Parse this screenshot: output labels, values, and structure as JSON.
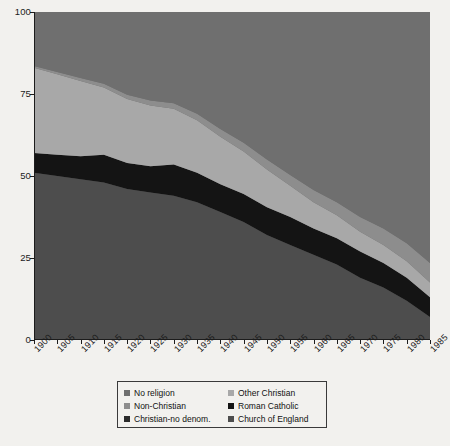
{
  "chart_data": {
    "type": "area",
    "title": "",
    "subtitle": "",
    "xlabel": "",
    "ylabel": "",
    "stacked": true,
    "percent_stacked": true,
    "grid": false,
    "legend_position": "bottom",
    "xlim": [
      1900,
      1985
    ],
    "ylim": [
      0,
      100
    ],
    "yticks": [
      0,
      25,
      50,
      75,
      100
    ],
    "categories": [
      1900,
      1905,
      1910,
      1915,
      1920,
      1925,
      1930,
      1935,
      1940,
      1945,
      1950,
      1955,
      1960,
      1965,
      1970,
      1975,
      1980,
      1985
    ],
    "xtick_labels": [
      "1900",
      "1905",
      "1910",
      "1915",
      "1920",
      "1925",
      "1930",
      "1935",
      "1940",
      "1945",
      "1950",
      "1955",
      "1960",
      "1965",
      "1970",
      "1975",
      "1980",
      "1985"
    ],
    "series": [
      {
        "name": "Church of England",
        "color": "#4d4d4d",
        "stack_order": 1,
        "values": [
          51,
          50,
          49,
          48,
          46,
          45,
          44,
          42,
          39,
          36,
          32,
          29,
          26,
          23,
          19,
          16,
          12,
          7
        ]
      },
      {
        "name": "Roman Catholic",
        "color": "#141414",
        "stack_order": 2,
        "values": [
          6,
          6.5,
          7,
          8.5,
          8,
          8,
          9.5,
          9,
          8.5,
          8.5,
          8.5,
          8.5,
          8,
          8,
          8,
          7.5,
          7,
          6
        ]
      },
      {
        "name": "Christian-no denom.",
        "color": "#5e5e5e",
        "stack_order": 3,
        "values": [
          0,
          0,
          0,
          0,
          0,
          0,
          0,
          0,
          0,
          0,
          0,
          0,
          0,
          0,
          0,
          0,
          0,
          0
        ]
      },
      {
        "name": "Other Christian",
        "color": "#a8a8a8",
        "stack_order": 4,
        "values": [
          26,
          24.5,
          23,
          20.5,
          19.5,
          18.5,
          17,
          16,
          14.5,
          13,
          11.5,
          9.5,
          8,
          7,
          6,
          5.5,
          5,
          4.5
        ]
      },
      {
        "name": "Non-Christian",
        "color": "#8d8d8d",
        "stack_order": 5,
        "values": [
          0.5,
          0.7,
          0.9,
          1.1,
          1.3,
          1.5,
          1.7,
          2.0,
          2.3,
          2.6,
          3.0,
          3.3,
          3.7,
          4.0,
          4.5,
          5.0,
          5.5,
          6.0
        ]
      },
      {
        "name": "No religion",
        "color": "#6f6f6f",
        "stack_order": 6,
        "values": [
          16.5,
          18.3,
          20.1,
          21.9,
          25.2,
          27.0,
          27.8,
          31.0,
          35.7,
          39.9,
          45.0,
          49.7,
          54.3,
          58.0,
          62.5,
          66.0,
          70.5,
          76.5
        ]
      }
    ],
    "band_boundaries_cumulative": {
      "note": "cumulative upper edge of each stacked band, bottom-to-top",
      "church_of_england_top": [
        51,
        50,
        49,
        48,
        46,
        45,
        44,
        42,
        39,
        36,
        32,
        29,
        26,
        23,
        19,
        16,
        12,
        7
      ],
      "roman_catholic_top": [
        57,
        56.5,
        56,
        56.5,
        54,
        53,
        53.5,
        51,
        47.5,
        44.5,
        40.5,
        37.5,
        34,
        31,
        27,
        23.5,
        19,
        13
      ],
      "christian_no_denom_top": [
        57,
        56.5,
        56,
        56.5,
        54,
        53,
        53.5,
        51,
        47.5,
        44.5,
        40.5,
        37.5,
        34,
        31,
        27,
        23.5,
        19,
        13
      ],
      "other_christian_top": [
        83,
        81,
        79,
        77,
        73.5,
        71.5,
        70.5,
        67,
        62,
        57.5,
        52,
        47,
        42,
        38,
        33,
        29,
        24,
        17.5
      ],
      "non_christian_top": [
        83.5,
        81.7,
        79.9,
        78.1,
        74.8,
        73.0,
        72.2,
        69.0,
        64.3,
        60.1,
        55.0,
        50.3,
        45.7,
        42.0,
        37.5,
        34.0,
        29.5,
        23.5
      ],
      "total_top": [
        100,
        100,
        100,
        100,
        100,
        100,
        100,
        100,
        100,
        100,
        100,
        100,
        100,
        100,
        100,
        100,
        100,
        100
      ]
    }
  },
  "legend": {
    "items": [
      {
        "label": "No religion",
        "color": "#6f6f6f"
      },
      {
        "label": "Other Christian",
        "color": "#a8a8a8"
      },
      {
        "label": "Non-Christian",
        "color": "#8d8d8d"
      },
      {
        "label": "Roman Catholic",
        "color": "#141414"
      },
      {
        "label": "Christian-no denom.",
        "color": "#2b2b2b"
      },
      {
        "label": "Church of England",
        "color": "#4d4d4d"
      }
    ]
  },
  "axes": {
    "y_tick_labels": [
      "100",
      "75",
      "50",
      "25",
      "0"
    ],
    "x_tick_labels": [
      "1900",
      "1905",
      "1910",
      "1915",
      "1920",
      "1925",
      "1930",
      "1935",
      "1940",
      "1945",
      "1950",
      "1955",
      "1960",
      "1965",
      "1970",
      "1975",
      "1980",
      "1985"
    ]
  }
}
